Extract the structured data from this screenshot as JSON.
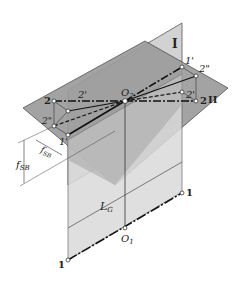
{
  "diagram": {
    "planes": [
      {
        "id": "I",
        "label": "I",
        "orientation": "vertical"
      },
      {
        "id": "II",
        "label": "II",
        "orientation": "inclined"
      }
    ],
    "labels": {
      "plane_I": "I",
      "plane_II": "II",
      "o2": "O",
      "o2_sub": "2",
      "o1": "O",
      "o1_sub": "1",
      "p1_prime_right": "1'",
      "p2_dprime_right": "2\"",
      "p2_prime_right": "2'",
      "p2_right": "2",
      "p2_left": "2",
      "p2_prime_left": "2'",
      "p2_dprime_left": "2\"",
      "p1_prime_left": "1'",
      "p1_bottom_right": "1",
      "p1_bottom_left": "1",
      "dim_vertical": "f",
      "dim_vertical_sub": "SB",
      "dim_diagonal": "f",
      "dim_diagonal_sub": "SB",
      "dim_length": "L",
      "dim_length_sub": "G"
    }
  }
}
